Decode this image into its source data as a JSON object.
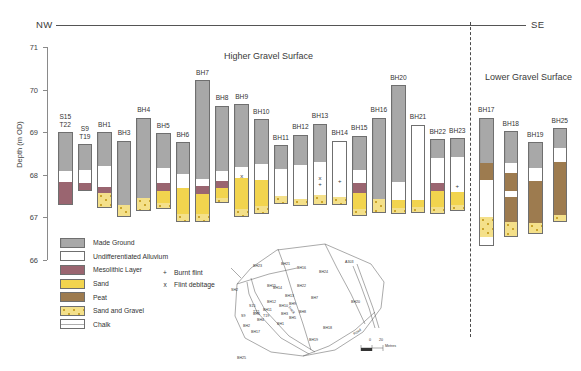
{
  "figure": {
    "direction_left": "NW",
    "direction_right": "SE",
    "section_titles": {
      "higher": "Higher Gravel Surface",
      "lower": "Lower Gravel Surface"
    }
  },
  "axis": {
    "label": "Depth (m OD)",
    "ticks": [
      "71",
      "70",
      "69",
      "68",
      "67",
      "66"
    ],
    "min": 66,
    "max": 71
  },
  "legend": {
    "items": [
      {
        "key": "made",
        "label": "Made Ground",
        "color": "#a8a8a8"
      },
      {
        "key": "allu",
        "label": "Undifferentiated Alluvium",
        "color": "#ffffff"
      },
      {
        "key": "meso",
        "label": "Mesolithic Layer",
        "color": "#9a6570"
      },
      {
        "key": "sand",
        "label": "Sand",
        "color": "#f2d44e"
      },
      {
        "key": "peat",
        "label": "Peat",
        "color": "#9d7b4f"
      },
      {
        "key": "sg",
        "label": "Sand and Gravel",
        "color": "#f4e08a"
      },
      {
        "key": "chalk",
        "label": "Chalk",
        "color": "#ffffff"
      }
    ],
    "points": [
      {
        "symbol": "+",
        "label": "Burnt flint"
      },
      {
        "symbol": "x",
        "label": "Flint debitage"
      }
    ]
  },
  "inset_map": {
    "scale_label": "Metres",
    "scale_ticks": [
      "0",
      "20"
    ],
    "road_labels": [
      "A303",
      "Road",
      "Track"
    ],
    "borehole_labels": [
      "BH23",
      "BH21",
      "BH16",
      "BH15",
      "SH2",
      "BH14",
      "BH22",
      "BH13",
      "BH12",
      "BH20",
      "BH11",
      "BH10",
      "BH9",
      "BH7",
      "BH8",
      "BH6",
      "BH4",
      "T19",
      "BH3",
      "BH5",
      "BH17",
      "BH19",
      "BH18",
      "BH1",
      "BH25",
      "BH2",
      "S15",
      "T22",
      "S9",
      "BH24"
    ]
  },
  "chart_data": {
    "type": "table",
    "ylabel": "Depth (m OD)",
    "ylim": [
      66,
      71
    ],
    "units": "m OD",
    "panels": [
      {
        "name": "Higher Gravel Surface",
        "boreholes": [
          {
            "label": "S15\nT22",
            "top": 69.0,
            "base": 67.28,
            "layers": [
              {
                "type": "made",
                "from": 69.0,
                "to": 68.1
              },
              {
                "type": "allu",
                "from": 68.1,
                "to": 67.82
              },
              {
                "type": "meso",
                "from": 67.82,
                "to": 67.28
              }
            ],
            "markers": []
          },
          {
            "label": "S9\nT19",
            "top": 68.72,
            "base": 67.62,
            "layers": [
              {
                "type": "made",
                "from": 68.72,
                "to": 68.12
              },
              {
                "type": "allu",
                "from": 68.12,
                "to": 67.8
              },
              {
                "type": "meso",
                "from": 67.8,
                "to": 67.62
              }
            ],
            "markers": []
          },
          {
            "label": "BH1",
            "top": 69.0,
            "base": 67.22,
            "layers": [
              {
                "type": "made",
                "from": 69.0,
                "to": 68.2
              },
              {
                "type": "allu",
                "from": 68.2,
                "to": 67.72
              },
              {
                "type": "meso",
                "from": 67.72,
                "to": 67.58
              },
              {
                "type": "sg",
                "from": 67.58,
                "to": 67.22
              }
            ],
            "markers": []
          },
          {
            "label": "BH3",
            "top": 68.8,
            "base": 67.02,
            "layers": [
              {
                "type": "made",
                "from": 68.8,
                "to": 67.28
              },
              {
                "type": "sg",
                "from": 67.28,
                "to": 67.02
              }
            ],
            "markers": []
          },
          {
            "label": "BH4",
            "top": 69.34,
            "base": 67.14,
            "layers": [
              {
                "type": "made",
                "from": 69.34,
                "to": 67.46
              },
              {
                "type": "sg",
                "from": 67.46,
                "to": 67.14
              }
            ],
            "markers": []
          },
          {
            "label": "BH5",
            "top": 68.98,
            "base": 67.2,
            "layers": [
              {
                "type": "made",
                "from": 68.98,
                "to": 68.16
              },
              {
                "type": "allu",
                "from": 68.16,
                "to": 67.8
              },
              {
                "type": "meso",
                "from": 67.8,
                "to": 67.62
              },
              {
                "type": "sand",
                "from": 67.62,
                "to": 67.34
              },
              {
                "type": "sg",
                "from": 67.34,
                "to": 67.2
              }
            ],
            "markers": []
          },
          {
            "label": "BH6",
            "top": 68.76,
            "base": 66.9,
            "layers": [
              {
                "type": "made",
                "from": 68.76,
                "to": 68.02
              },
              {
                "type": "allu",
                "from": 68.02,
                "to": 67.7
              },
              {
                "type": "sand",
                "from": 67.7,
                "to": 67.08
              },
              {
                "type": "sg",
                "from": 67.08,
                "to": 66.9
              }
            ],
            "markers": []
          },
          {
            "label": "BH7",
            "top": 70.22,
            "base": 66.9,
            "layers": [
              {
                "type": "made",
                "from": 70.22,
                "to": 67.9
              },
              {
                "type": "allu",
                "from": 67.9,
                "to": 67.74
              },
              {
                "type": "meso",
                "from": 67.74,
                "to": 67.54
              },
              {
                "type": "sand",
                "from": 67.54,
                "to": 67.08
              },
              {
                "type": "sg",
                "from": 67.08,
                "to": 66.9
              }
            ],
            "markers": []
          },
          {
            "label": "BH8",
            "top": 69.62,
            "base": 67.34,
            "layers": [
              {
                "type": "made",
                "from": 69.62,
                "to": 68.08
              },
              {
                "type": "allu",
                "from": 68.08,
                "to": 67.86
              },
              {
                "type": "meso",
                "from": 67.86,
                "to": 67.7
              },
              {
                "type": "sand",
                "from": 67.7,
                "to": 67.46
              },
              {
                "type": "sg",
                "from": 67.46,
                "to": 67.34
              }
            ],
            "markers": []
          },
          {
            "label": "BH9",
            "top": 69.66,
            "base": 67.02,
            "layers": [
              {
                "type": "made",
                "from": 69.66,
                "to": 68.18
              },
              {
                "type": "allu",
                "from": 68.18,
                "to": 67.92
              },
              {
                "type": "sand",
                "from": 67.92,
                "to": 67.2
              },
              {
                "type": "sg",
                "from": 67.2,
                "to": 67.02
              }
            ],
            "markers": [
              {
                "symbol": "x",
                "depth": 67.98
              }
            ]
          },
          {
            "label": "BH10",
            "top": 69.3,
            "base": 67.08,
            "layers": [
              {
                "type": "made",
                "from": 69.3,
                "to": 68.26
              },
              {
                "type": "allu",
                "from": 68.26,
                "to": 67.88
              },
              {
                "type": "sand",
                "from": 67.88,
                "to": 67.26
              },
              {
                "type": "sg",
                "from": 67.26,
                "to": 67.08
              }
            ],
            "markers": []
          },
          {
            "label": "BH11",
            "top": 68.7,
            "base": 67.32,
            "layers": [
              {
                "type": "made",
                "from": 68.7,
                "to": 68.14
              },
              {
                "type": "allu",
                "from": 68.14,
                "to": 67.5
              },
              {
                "type": "sg",
                "from": 67.5,
                "to": 67.32
              }
            ],
            "markers": []
          },
          {
            "label": "BH12",
            "top": 68.94,
            "base": 67.26,
            "layers": [
              {
                "type": "made",
                "from": 68.94,
                "to": 68.22
              },
              {
                "type": "allu",
                "from": 68.22,
                "to": 67.44
              },
              {
                "type": "sg",
                "from": 67.44,
                "to": 67.26
              }
            ],
            "markers": []
          },
          {
            "label": "BH13",
            "top": 69.2,
            "base": 67.3,
            "layers": [
              {
                "type": "made",
                "from": 69.2,
                "to": 68.3
              },
              {
                "type": "allu",
                "from": 68.3,
                "to": 67.52
              },
              {
                "type": "sg",
                "from": 67.52,
                "to": 67.3
              }
            ],
            "markers": [
              {
                "symbol": "x",
                "depth": 67.92
              },
              {
                "symbol": "+",
                "depth": 67.78
              }
            ]
          },
          {
            "label": "BH14",
            "top": 68.8,
            "base": 67.3,
            "layers": [
              {
                "type": "allu",
                "from": 68.8,
                "to": 67.48
              },
              {
                "type": "sg",
                "from": 67.48,
                "to": 67.3
              }
            ],
            "markers": [
              {
                "symbol": "+",
                "depth": 67.86
              }
            ]
          },
          {
            "label": "BH15",
            "top": 68.92,
            "base": 67.04,
            "layers": [
              {
                "type": "made",
                "from": 68.92,
                "to": 68.12
              },
              {
                "type": "allu",
                "from": 68.12,
                "to": 67.8
              },
              {
                "type": "meso",
                "from": 67.8,
                "to": 67.58
              },
              {
                "type": "sand",
                "from": 67.58,
                "to": 67.2
              },
              {
                "type": "sg",
                "from": 67.2,
                "to": 67.04
              }
            ],
            "markers": []
          },
          {
            "label": "BH16",
            "top": 69.34,
            "base": 67.1,
            "layers": [
              {
                "type": "made",
                "from": 69.34,
                "to": 67.42
              },
              {
                "type": "sg",
                "from": 67.42,
                "to": 67.1
              }
            ],
            "markers": []
          },
          {
            "label": "BH20",
            "top": 70.1,
            "base": 67.08,
            "layers": [
              {
                "type": "made",
                "from": 70.1,
                "to": 67.84
              },
              {
                "type": "allu",
                "from": 67.84,
                "to": 67.4
              },
              {
                "type": "sand",
                "from": 67.4,
                "to": 67.22
              },
              {
                "type": "sg",
                "from": 67.22,
                "to": 67.08
              }
            ],
            "markers": []
          },
          {
            "label": "BH21",
            "top": 69.18,
            "base": 67.1,
            "layers": [
              {
                "type": "allu",
                "from": 69.18,
                "to": 67.42
              },
              {
                "type": "sand",
                "from": 67.42,
                "to": 67.24
              },
              {
                "type": "sg",
                "from": 67.24,
                "to": 67.1
              }
            ],
            "markers": []
          },
          {
            "label": "BH22",
            "top": 68.84,
            "base": 67.08,
            "layers": [
              {
                "type": "made",
                "from": 68.84,
                "to": 68.4
              },
              {
                "type": "allu",
                "from": 68.4,
                "to": 67.8
              },
              {
                "type": "meso",
                "from": 67.8,
                "to": 67.62
              },
              {
                "type": "sand",
                "from": 67.62,
                "to": 67.24
              },
              {
                "type": "sg",
                "from": 67.24,
                "to": 67.08
              }
            ],
            "markers": []
          },
          {
            "label": "BH23",
            "top": 68.86,
            "base": 67.14,
            "layers": [
              {
                "type": "made",
                "from": 68.86,
                "to": 68.42
              },
              {
                "type": "allu",
                "from": 68.42,
                "to": 67.6
              },
              {
                "type": "sand",
                "from": 67.6,
                "to": 67.28
              },
              {
                "type": "sg",
                "from": 67.28,
                "to": 67.14
              }
            ],
            "markers": [
              {
                "symbol": "+",
                "depth": 67.74
              }
            ]
          }
        ]
      },
      {
        "name": "Lower Gravel Surface",
        "boreholes": [
          {
            "label": "BH17",
            "top": 69.34,
            "base": 66.32,
            "layers": [
              {
                "type": "made",
                "from": 69.34,
                "to": 68.28
              },
              {
                "type": "peat",
                "from": 68.28,
                "to": 67.88
              },
              {
                "type": "allu",
                "from": 67.88,
                "to": 67.02
              },
              {
                "type": "sg",
                "from": 67.02,
                "to": 66.54
              },
              {
                "type": "chalk",
                "from": 66.54,
                "to": 66.32
              }
            ],
            "markers": []
          },
          {
            "label": "BH18",
            "top": 69.02,
            "base": 66.54,
            "layers": [
              {
                "type": "made",
                "from": 69.02,
                "to": 68.28
              },
              {
                "type": "allu",
                "from": 68.28,
                "to": 68.04
              },
              {
                "type": "peat",
                "from": 68.04,
                "to": 67.62
              },
              {
                "type": "allu",
                "from": 67.62,
                "to": 67.48
              },
              {
                "type": "peat",
                "from": 67.48,
                "to": 66.9
              },
              {
                "type": "sg",
                "from": 66.9,
                "to": 66.54
              }
            ],
            "markers": []
          },
          {
            "label": "BH19",
            "top": 68.76,
            "base": 66.6,
            "layers": [
              {
                "type": "made",
                "from": 68.76,
                "to": 68.16
              },
              {
                "type": "allu",
                "from": 68.16,
                "to": 67.86
              },
              {
                "type": "peat",
                "from": 67.86,
                "to": 66.86
              },
              {
                "type": "sg",
                "from": 66.86,
                "to": 66.6
              }
            ],
            "markers": []
          },
          {
            "label": "BH25",
            "top": 69.1,
            "base": 66.88,
            "layers": [
              {
                "type": "made",
                "from": 69.1,
                "to": 68.62
              },
              {
                "type": "allu",
                "from": 68.62,
                "to": 68.3
              },
              {
                "type": "peat",
                "from": 68.3,
                "to": 67.06
              },
              {
                "type": "sg",
                "from": 67.06,
                "to": 66.88
              }
            ],
            "markers": []
          }
        ]
      }
    ]
  }
}
